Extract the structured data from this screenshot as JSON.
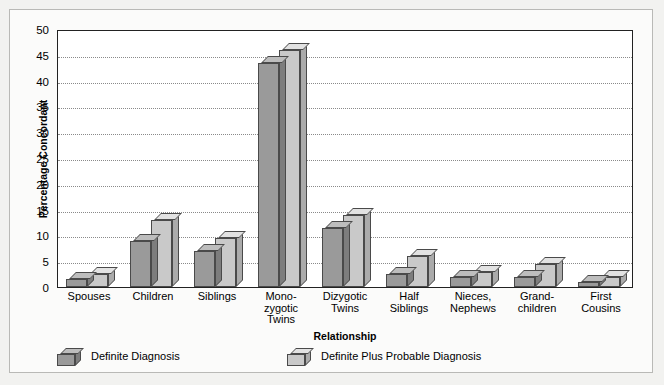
{
  "chart_data": {
    "type": "bar",
    "title": "",
    "xlabel": "Relationship",
    "ylabel": "Percentage Concordant",
    "ylim": [
      0,
      50
    ],
    "ytick_step": 5,
    "yticks": [
      50,
      45,
      40,
      35,
      30,
      25,
      20,
      15,
      10,
      5,
      0
    ],
    "grid": true,
    "grid_axis": "y",
    "legend_position": "bottom-left",
    "style": "3d-bar",
    "categories": [
      "Spouses",
      "Children",
      "Siblings",
      "Mono-\nzygotic\nTwins",
      "Dizygotic\nTwins",
      "Half\nSiblings",
      "Nieces,\nNephews",
      "Grand-\nchildren",
      "First\nCousins"
    ],
    "series": [
      {
        "name": "Definite Diagnosis",
        "color": "#9a9a9a",
        "values": [
          1.5,
          9.0,
          7.0,
          43.5,
          11.5,
          2.5,
          2.0,
          2.0,
          1.0
        ]
      },
      {
        "name": "Definite Plus Probable Diagnosis",
        "color": "#c9c9c9",
        "values": [
          2.5,
          13.0,
          9.5,
          46.0,
          14.0,
          6.0,
          3.0,
          4.5,
          2.0
        ]
      }
    ]
  },
  "legend": {
    "items": [
      {
        "label": "Definite Diagnosis",
        "swatch": "cube-dark-icon"
      },
      {
        "label": "Definite Plus Probable Diagnosis",
        "swatch": "cube-light-icon"
      }
    ]
  }
}
